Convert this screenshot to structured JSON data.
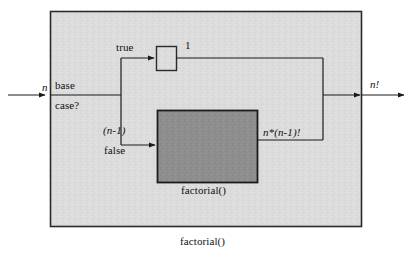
{
  "diagram": {
    "type": "recursion-flow-diagram",
    "outer_box": {
      "caption": "factorial()",
      "fill_color": "#dcdcdc",
      "border_color": "#2b2b2b"
    },
    "inner_box": {
      "caption": "factorial()",
      "fill_color": "#8e8e8e",
      "border_color": "#1c1c1c"
    },
    "base_case_node": {
      "line1": "base",
      "line2": "case?"
    },
    "one_box": {
      "fill_color": "#dcdcdc",
      "border_color": "#2b2b2b"
    },
    "labels": {
      "input": "n",
      "output": "n!",
      "true_branch": "true",
      "false_branch": "false",
      "one_value": "1",
      "recursive_arg": "(n-1)",
      "recursive_result": "n*(n-1)!"
    }
  }
}
